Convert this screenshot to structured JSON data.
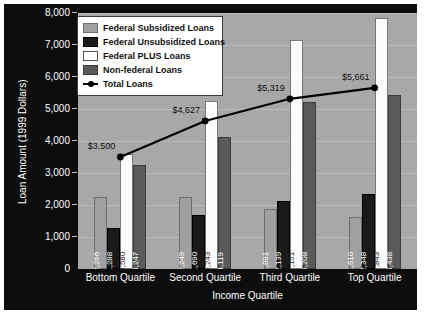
{
  "chart_data": {
    "type": "bar",
    "title": "",
    "xlabel": "Income Quartile",
    "ylabel": "Loan Amount (1999 Dollars)",
    "categories": [
      "Bottom Quartile",
      "Second Quartile",
      "Third Quartile",
      "Top Quartile"
    ],
    "ylim": [
      0,
      8000
    ],
    "yticks": [
      "0",
      "1,000",
      "2,000",
      "3,000",
      "4,000",
      "5,000",
      "6,000",
      "7,000",
      "8,000"
    ],
    "ytick_values": [
      0,
      1000,
      2000,
      3000,
      4000,
      5000,
      6000,
      7000,
      8000
    ],
    "grid": true,
    "legend_position": "top-left",
    "series": [
      {
        "name": "Federal Subsidized Loans",
        "type": "bar",
        "color": "#a0a0a0",
        "values": [
          2266,
          2249,
          1891,
          1610
        ],
        "labels": [
          "$2,266",
          "$2,249",
          "$1,891",
          "$1,610"
        ]
      },
      {
        "name": "Federal Unsubsidized Loans",
        "type": "bar",
        "color": "#1a1a1a",
        "values": [
          1288,
          1690,
          2139,
          2348
        ],
        "labels": [
          "$1,288",
          "$1,690",
          "$2,139",
          "$2,348"
        ]
      },
      {
        "name": "Federal PLUS Loans",
        "type": "bar",
        "color": "#ffffff",
        "values": [
          3580,
          5243,
          7151,
          7843
        ],
        "labels": [
          "$3,580",
          "$5,243",
          "$7,151",
          "$7,843"
        ]
      },
      {
        "name": "Non-federal Loans",
        "type": "bar",
        "color": "#5a5a5a",
        "values": [
          3247,
          4119,
          5208,
          5438
        ],
        "labels": [
          "$3,247",
          "$4,119",
          "$5,208",
          "$5,438"
        ]
      },
      {
        "name": "Total Loans",
        "type": "line",
        "color": "#000000",
        "values": [
          3500,
          4627,
          5319,
          5661
        ],
        "labels": [
          "$3,500",
          "$4,627",
          "$5,319",
          "$5,661"
        ]
      }
    ]
  },
  "colors": {
    "frame_background": "#0d0d0d",
    "plot_background": "#a8a8a8",
    "gridline": "#bbbbbb",
    "axis_text": "#ffffff",
    "legend_background": "#ffffff"
  }
}
